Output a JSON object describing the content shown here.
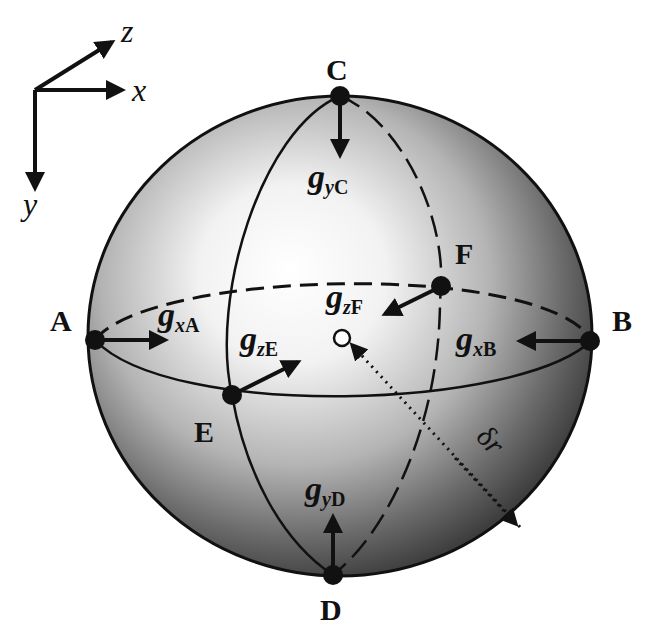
{
  "figure": {
    "type": "sphere-gradient-diagram",
    "background": "#ffffff",
    "line_color": "#111111"
  },
  "axes": {
    "x_label": "x",
    "y_label": "y",
    "z_label": "z"
  },
  "points": {
    "A": "A",
    "B": "B",
    "C": "C",
    "D": "D",
    "E": "E",
    "F": "F"
  },
  "vectors": [
    {
      "id": "gxA",
      "base": "g",
      "sub_var": "x",
      "sub_pt": "A",
      "direction": "+x (right)"
    },
    {
      "id": "gxB",
      "base": "g",
      "sub_var": "x",
      "sub_pt": "B",
      "direction": "-x (left)"
    },
    {
      "id": "gyC",
      "base": "g",
      "sub_var": "y",
      "sub_pt": "C",
      "direction": "down"
    },
    {
      "id": "gyD",
      "base": "g",
      "sub_var": "y",
      "sub_pt": "D",
      "direction": "up"
    },
    {
      "id": "gzE",
      "base": "g",
      "sub_var": "z",
      "sub_pt": "E",
      "direction": "up-right"
    },
    {
      "id": "gzF",
      "base": "g",
      "sub_var": "z",
      "sub_pt": "F",
      "direction": "down-left"
    }
  ],
  "radius_label": {
    "symbol": "δ",
    "var": "r"
  }
}
